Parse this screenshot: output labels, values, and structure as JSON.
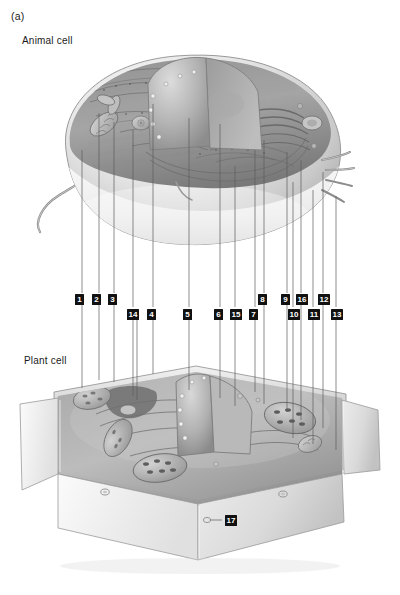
{
  "figure": {
    "panel_letter": "(a)",
    "animal_cell_caption": "Animal cell",
    "plant_cell_caption": "Plant cell",
    "badge_color": "#111111",
    "badge_text_color": "#ffffff",
    "leader_line_color": "#5d5d5d",
    "background_color": "#ffffff"
  },
  "labels": {
    "upper_row": [
      {
        "number": "1",
        "x": 75,
        "y": 294,
        "line_x": 82,
        "target": "animal-cell"
      },
      {
        "number": "2",
        "x": 92,
        "y": 294,
        "line_x": 99,
        "target": "animal-cell"
      },
      {
        "number": "3",
        "x": 108,
        "y": 294,
        "line_x": 114,
        "target": "animal-cell"
      },
      {
        "number": "8",
        "x": 258,
        "y": 294,
        "line_x": 264,
        "target": "animal-cell"
      },
      {
        "number": "9",
        "x": 281,
        "y": 294,
        "line_x": 287,
        "target": "animal-cell"
      },
      {
        "number": "16",
        "x": 296,
        "y": 294,
        "line_x": 301,
        "target": "animal-cell"
      },
      {
        "number": "12",
        "x": 318,
        "y": 294,
        "line_x": 323,
        "target": "animal-cell"
      }
    ],
    "lower_row": [
      {
        "number": "14",
        "x": 127,
        "y": 309,
        "line_x": 133,
        "target": "plant-cell"
      },
      {
        "number": "4",
        "x": 147,
        "y": 309,
        "line_x": 153,
        "target": "plant-cell"
      },
      {
        "number": "5",
        "x": 183,
        "y": 309,
        "line_x": 189,
        "target": "plant-cell"
      },
      {
        "number": "6",
        "x": 214,
        "y": 309,
        "line_x": 220,
        "target": "plant-cell"
      },
      {
        "number": "15",
        "x": 230,
        "y": 309,
        "line_x": 235,
        "target": "plant-cell"
      },
      {
        "number": "7",
        "x": 249,
        "y": 309,
        "line_x": 255,
        "target": "plant-cell"
      },
      {
        "number": "10",
        "x": 288,
        "y": 309,
        "line_x": 293,
        "target": "plant-cell"
      },
      {
        "number": "11",
        "x": 308,
        "y": 309,
        "line_x": 313,
        "target": "plant-cell"
      },
      {
        "number": "13",
        "x": 331,
        "y": 309,
        "line_x": 336,
        "target": "plant-cell"
      }
    ],
    "standalone": [
      {
        "number": "17",
        "x": 225,
        "y": 515,
        "leader_from_x": 222,
        "leader_to_x": 207,
        "leader_y": 520,
        "target": "plant-cell-wall"
      }
    ]
  },
  "diagram": {
    "type": "labelled-biological-illustration",
    "subjects": [
      "animal cell",
      "plant cell"
    ],
    "style": "grayscale pencil/airbrush rendering, cut-away three-quarter view",
    "animal_cell": {
      "shape": "rounded kidney / dome form",
      "features": [
        "flagellum at lower left",
        "microvilli at right edge",
        "cut-away wedge exposing nucleus",
        "nucleus with nuclear envelope and pores",
        "endoplasmic reticulum",
        "Golgi apparatus",
        "mitochondria",
        "ribosomes",
        "plasma membrane"
      ]
    },
    "plant_cell": {
      "shape": "angular box with rigid cell wall",
      "features": [
        "rigid cell wall",
        "large central vacuole cut away",
        "nucleus with pores",
        "chloroplasts with grana",
        "mitochondria",
        "endoplasmic reticulum",
        "Golgi apparatus",
        "plasmodesmata pits in wall"
      ]
    }
  }
}
